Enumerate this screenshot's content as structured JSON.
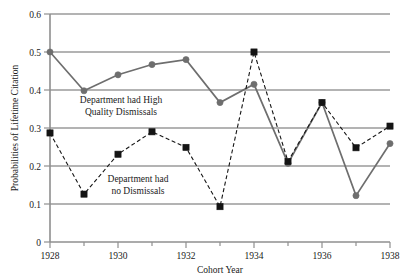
{
  "chart_data": {
    "type": "line",
    "title": "",
    "xlabel": "Cohort Year",
    "ylabel": "Probabilities of Lifetime Citation",
    "x": [
      1928,
      1929,
      1930,
      1931,
      1932,
      1933,
      1934,
      1935,
      1936,
      1937,
      1938
    ],
    "xlim": [
      1928,
      1938
    ],
    "ylim": [
      0,
      0.6
    ],
    "xticks": [
      1928,
      1929,
      1930,
      1931,
      1932,
      1933,
      1934,
      1935,
      1936,
      1937,
      1938
    ],
    "xtick_labels": [
      "1928",
      "",
      "1930",
      "",
      "1932",
      "",
      "1934",
      "",
      "1936",
      "",
      "1938"
    ],
    "xtick_labels_major": [
      "1928",
      "1930",
      "1932",
      "1934",
      "1936",
      "1938"
    ],
    "yticks": [
      0,
      0.1,
      0.2,
      0.3,
      0.4,
      0.5,
      0.6
    ],
    "ytick_labels": [
      "0",
      "0.1",
      "0.2",
      "0.3",
      "0.4",
      "0.5",
      "0.6"
    ],
    "grid": "horizontal",
    "legend_position": "inline-annotations",
    "series": [
      {
        "name": "Department had High Quality Dismissals",
        "style": "solid",
        "marker": "circle",
        "color": "#6e6e6e",
        "values": [
          0.5,
          0.398,
          0.44,
          0.467,
          0.48,
          0.367,
          0.415,
          0.207,
          0.367,
          0.122,
          0.259
        ]
      },
      {
        "name": "Department had no Dismissals",
        "style": "dashed",
        "marker": "square",
        "color": "#141414",
        "values": [
          0.287,
          0.126,
          0.231,
          0.29,
          0.249,
          0.093,
          0.5,
          0.212,
          0.367,
          0.248,
          0.305
        ]
      }
    ],
    "annotations": [
      {
        "id": "high-quality",
        "line1": "Department had High",
        "line2": "Quality Dismissals"
      },
      {
        "id": "no-dismissals",
        "line1": "Department had",
        "line2": "no Dismissals"
      }
    ]
  },
  "colors": {
    "solid_series": "#6e6e6e",
    "dashed_series": "#141414",
    "gridline": "#9a9a9a",
    "axis": "#8f8f8f",
    "text": "#1a1a1a",
    "background": "#ffffff"
  }
}
